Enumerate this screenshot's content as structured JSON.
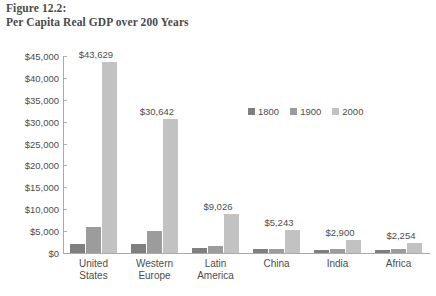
{
  "figure": {
    "number": "Figure 12.2:",
    "title": "Per Capita Real GDP over 200 Years"
  },
  "chart_data": {
    "type": "bar",
    "title": "Per Capita Real GDP over 200 Years",
    "xlabel": "",
    "ylabel": "",
    "ylim": [
      0,
      45000
    ],
    "ytick_step": 5000,
    "grid": false,
    "legend_position": "inside-upper-right",
    "categories": [
      "United States",
      "Western Europe",
      "Latin America",
      "China",
      "India",
      "Africa"
    ],
    "category_lines": [
      [
        "United",
        "States"
      ],
      [
        "Western",
        "Europe"
      ],
      [
        "Latin",
        "America"
      ],
      [
        "China"
      ],
      [
        "India"
      ],
      [
        "Africa"
      ]
    ],
    "ytick_labels": [
      "$0",
      "$5,000",
      "$10,000",
      "$15,000",
      "$20,000",
      "$25,000",
      "$30,000",
      "$35,000",
      "$40,000",
      "$45,000"
    ],
    "ytick_values": [
      0,
      5000,
      10000,
      15000,
      20000,
      25000,
      30000,
      35000,
      40000,
      45000
    ],
    "series": [
      {
        "name": "1800",
        "color": "#7f7f7f",
        "values": [
          2000,
          2000,
          1100,
          1000,
          750,
          700
        ]
      },
      {
        "name": "1900",
        "color": "#9c9c9c",
        "values": [
          6000,
          5000,
          1700,
          1000,
          850,
          900
        ]
      },
      {
        "name": "2000",
        "color": "#c2c2c2",
        "values": [
          43629,
          30642,
          9026,
          5243,
          2900,
          2254
        ]
      }
    ],
    "data_labels": [
      "$43,629",
      "$30,642",
      "$9,026",
      "$5,243",
      "$2,900",
      "$2,254"
    ],
    "data_label_series": "2000"
  },
  "legend": {
    "items": [
      {
        "label": "1800",
        "color": "#7f7f7f"
      },
      {
        "label": "1900",
        "color": "#9c9c9c"
      },
      {
        "label": "2000",
        "color": "#c2c2c2"
      }
    ]
  }
}
